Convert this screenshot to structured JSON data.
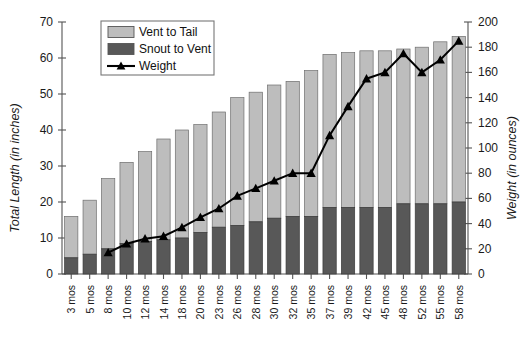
{
  "chart_data": {
    "type": "bar",
    "title": "",
    "subtitle": "",
    "xlabel": "",
    "ylabel": "Total Length (in inches)",
    "y2label": "Weight (in ounces)",
    "ylim": [
      0,
      70
    ],
    "y2lim": [
      0,
      200
    ],
    "yticks": [
      0,
      10,
      20,
      30,
      40,
      50,
      60,
      70
    ],
    "y2ticks": [
      0,
      20,
      40,
      60,
      80,
      100,
      120,
      140,
      160,
      180,
      200
    ],
    "grid": false,
    "stacked": true,
    "legend_position": "top-left-inset",
    "categories": [
      "3 mos",
      "5 mos",
      "8 mos",
      "10 mos",
      "12 mos",
      "14 mos",
      "18 mos",
      "20 mos",
      "23 mos",
      "26 mos",
      "28 mos",
      "30 mos",
      "32 mos",
      "35 mos",
      "37 mos",
      "39 mos",
      "42 mos",
      "45 mos",
      "48 mos",
      "52 mos",
      "55 mos",
      "58 mos"
    ],
    "series": [
      {
        "name": "Snout to Vent",
        "axis": "left",
        "type": "bar",
        "color": "#585858",
        "values": [
          4.5,
          5.5,
          7.0,
          8.5,
          9.0,
          9.5,
          10.0,
          11.5,
          13.0,
          13.5,
          14.5,
          15.5,
          16.0,
          16.0,
          18.5,
          18.5,
          18.5,
          18.5,
          19.5,
          19.5,
          19.5,
          20.0
        ]
      },
      {
        "name": "Vent to Tail",
        "axis": "left",
        "type": "bar",
        "color": "#bdbdbd",
        "values": [
          11.5,
          15.0,
          19.5,
          22.5,
          25.0,
          28.0,
          30.0,
          30.0,
          32.0,
          35.5,
          36.0,
          37.0,
          37.5,
          40.5,
          42.5,
          43.0,
          43.5,
          43.5,
          43.0,
          43.5,
          45.0,
          46.0
        ]
      },
      {
        "name": "Total Length",
        "axis": "left",
        "type": "bar-total",
        "values": [
          16.0,
          20.5,
          26.5,
          31.0,
          34.0,
          37.5,
          40.0,
          41.5,
          45.0,
          49.0,
          50.5,
          52.5,
          53.5,
          56.5,
          61.0,
          61.5,
          62.0,
          62.0,
          62.5,
          63.0,
          64.5,
          66.0
        ]
      },
      {
        "name": "Weight",
        "axis": "right",
        "type": "line",
        "color": "#000000",
        "marker": "triangle",
        "values": [
          null,
          null,
          17,
          24,
          28,
          30,
          37,
          45,
          52,
          62,
          68,
          74,
          80,
          80,
          110,
          133,
          155,
          160,
          175,
          160,
          170,
          185
        ]
      }
    ]
  },
  "legend": {
    "items": [
      {
        "label": "Vent to Tail",
        "swatch": "#bdbdbd",
        "kind": "box"
      },
      {
        "label": "Snout to Vent",
        "swatch": "#585858",
        "kind": "box"
      },
      {
        "label": "Weight",
        "swatch": "#000000",
        "kind": "line-marker"
      }
    ]
  },
  "axes": {
    "left_title": "Total Length (in inches)",
    "right_title": "Weight (in ounces)"
  }
}
